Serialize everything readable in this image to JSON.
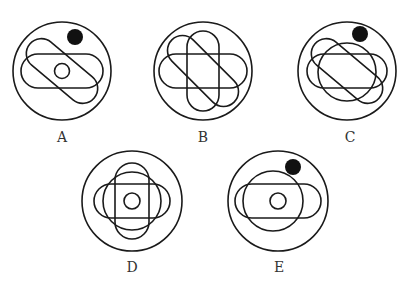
{
  "figures": [
    {
      "id": "A",
      "label": "A",
      "has_black_dot": true,
      "has_inner_circle": true,
      "has_medium_circle": false,
      "shapes": [
        "horizontal-capsule",
        "diagonal-capsule"
      ]
    },
    {
      "id": "B",
      "label": "B",
      "has_black_dot": false,
      "has_inner_circle": false,
      "has_medium_circle": false,
      "shapes": [
        "horizontal-capsule",
        "vertical-capsule",
        "diagonal-capsule"
      ]
    },
    {
      "id": "C",
      "label": "C",
      "has_black_dot": true,
      "has_inner_circle": false,
      "has_medium_circle": true,
      "shapes": [
        "horizontal-capsule",
        "diagonal-capsule"
      ]
    },
    {
      "id": "D",
      "label": "D",
      "has_black_dot": false,
      "has_inner_circle": true,
      "has_medium_circle": true,
      "shapes": [
        "horizontal-capsule",
        "vertical-capsule"
      ]
    },
    {
      "id": "E",
      "label": "E",
      "has_black_dot": true,
      "has_inner_circle": true,
      "has_medium_circle": true,
      "shapes": [
        "horizontal-capsule"
      ]
    }
  ],
  "colors": {
    "stroke": "#1a1a1a",
    "dot": "#111111",
    "label": "#333333"
  }
}
